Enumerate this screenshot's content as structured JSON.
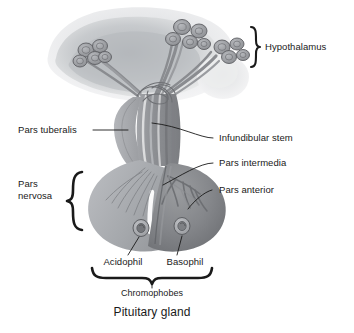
{
  "figure": {
    "title": "Pituitary gland",
    "background_color": "#ffffff",
    "line_color": "#1a1a1a",
    "text_color": "#1a1a1a"
  },
  "labels": {
    "hypothalamus": "Hypothalamus",
    "pars_tuberalis": "Pars tuberalis",
    "infundibular_stem": "Infundibular stem",
    "pars_intermedia": "Pars intermedia",
    "pars_nervosa_line1": "Pars",
    "pars_nervosa_line2": "nervosa",
    "pars_anterior": "Pars anterior",
    "acidophil": "Acidophil",
    "basophil": "Basophil",
    "chromophobes": "Chromophobes",
    "pituitary_gland": "Pituitary gland"
  },
  "anatomy": {
    "colors": {
      "hypothalamus_mass": "#b9bcc0",
      "hypothalamus_mass_light": "#dcdee1",
      "optic_lobe": "#e2e4e6",
      "stem": "#97999d",
      "stem_dark": "#7e8084",
      "pars_nervosa": "#a8abaf",
      "pars_anterior": "#8a8c90",
      "pars_anterior_dark": "#76787c",
      "pars_tuberalis": "#9b9ea2",
      "fiber_light": "#ffffff",
      "vessel": "#6e7074",
      "neuron_body": "#9a9ca0",
      "neuron_outline": "#5d5f63",
      "cell_fill": "#b2b4b8",
      "cell_nucleus": "#74767a"
    },
    "structures": [
      {
        "name": "hypothalamus",
        "description": "diffuse gray brain mass at top with neurosecretory cell clusters"
      },
      {
        "name": "neuron-clusters",
        "count": 3,
        "description": "grape-like clusters of neurosecretory cell bodies"
      },
      {
        "name": "infundibular-stem",
        "description": "vertical stalk with descending axon fiber tracts"
      },
      {
        "name": "pars-tuberalis",
        "description": "tissue collar on left of stem"
      },
      {
        "name": "pars-nervosa",
        "description": "lighter posterior lobe, left side of gland"
      },
      {
        "name": "pars-intermedia",
        "description": "narrow band between anterior and posterior lobes"
      },
      {
        "name": "pars-anterior",
        "description": "darker anterior lobe, right side of gland"
      },
      {
        "name": "acidophil-cell",
        "description": "small round cell in anterior lobe, left"
      },
      {
        "name": "basophil-cell",
        "description": "small round cell in anterior lobe, right"
      }
    ]
  }
}
